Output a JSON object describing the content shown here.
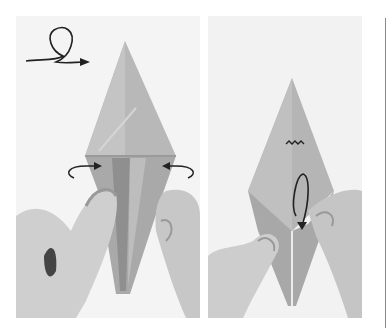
{
  "image": {
    "description": "Two-step origami folding photographs (grayscale)",
    "panels": [
      {
        "id": "step-left",
        "symbols": [
          "turn-over-loop-arrow",
          "fold-in-arrow-left",
          "fold-in-arrow-right"
        ],
        "subject": "kite-shaped folded paper held by two hands"
      },
      {
        "id": "step-right",
        "symbols": [
          "zigzag-pleat-mark",
          "swivel-fold-arrow"
        ],
        "subject": "kite-shaped folded paper with inner flap being pulled down"
      }
    ],
    "colors": {
      "paper": "#b5b5b5",
      "paper_shadow": "#8e8e8e",
      "skin": "#cfcfcf",
      "skin_shadow": "#9a9a9a",
      "background": "#f3f3f3",
      "ink": "#222222",
      "divider": "#888888"
    }
  }
}
